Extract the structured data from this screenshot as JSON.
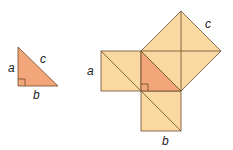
{
  "diagram": {
    "colors": {
      "triangle_fill": "#f2a679",
      "square_fill": "#fad9a1",
      "stroke": "#6b4a2e",
      "label": "#222222"
    },
    "small_triangle": {
      "labels": {
        "a": "a",
        "b": "b",
        "c": "c"
      }
    },
    "squares_figure": {
      "labels": {
        "a": "a",
        "b": "b",
        "c": "c"
      }
    }
  }
}
